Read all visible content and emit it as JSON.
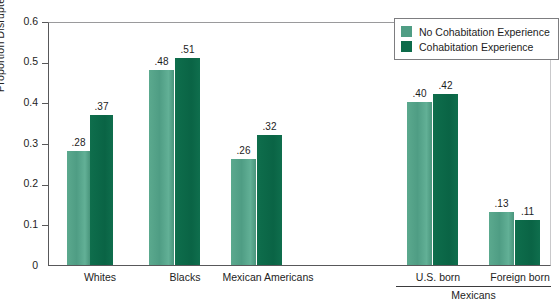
{
  "chart_data": {
    "type": "bar",
    "title": "",
    "xlabel": "",
    "ylabel": "Proportion Disrupted",
    "ylim": [
      0,
      0.6
    ],
    "ytick_labels": [
      "0",
      "0.1",
      "0.2",
      "0.3",
      "0.4",
      "0.5",
      "0.6"
    ],
    "ytick_values": [
      0,
      0.1,
      0.2,
      0.3,
      0.4,
      0.5,
      0.6
    ],
    "grid": false,
    "legend_position": "top-right",
    "categories": [
      "Whites",
      "Blacks",
      "Mexican Americans",
      "U.S. born",
      "Foreign born"
    ],
    "group_bracket": {
      "label": "Mexicans",
      "covers": [
        "U.S. born",
        "Foreign born"
      ]
    },
    "series": [
      {
        "name": "No Cohabitation Experience",
        "color": "#4f9d84",
        "values": [
          0.28,
          0.48,
          0.26,
          0.4,
          0.13
        ],
        "labels": [
          ".28",
          ".48",
          ".26",
          ".40",
          ".13"
        ]
      },
      {
        "name": "Cohabitation Experience",
        "color": "#0d6b4a",
        "values": [
          0.37,
          0.51,
          0.32,
          0.42,
          0.11
        ],
        "labels": [
          ".37",
          ".51",
          ".32",
          ".42",
          ".11"
        ]
      }
    ]
  },
  "legend": {
    "items": [
      {
        "label": "No Cohabitation Experience",
        "color": "#4f9d84"
      },
      {
        "label": "Cohabitation Experience",
        "color": "#0d6b4a"
      }
    ]
  },
  "axis": {
    "y_label": "Proportion Disrupted",
    "y_ticks": [
      "0.6",
      "0.5",
      "0.4",
      "0.3",
      "0.2",
      "0.1",
      "0"
    ]
  }
}
